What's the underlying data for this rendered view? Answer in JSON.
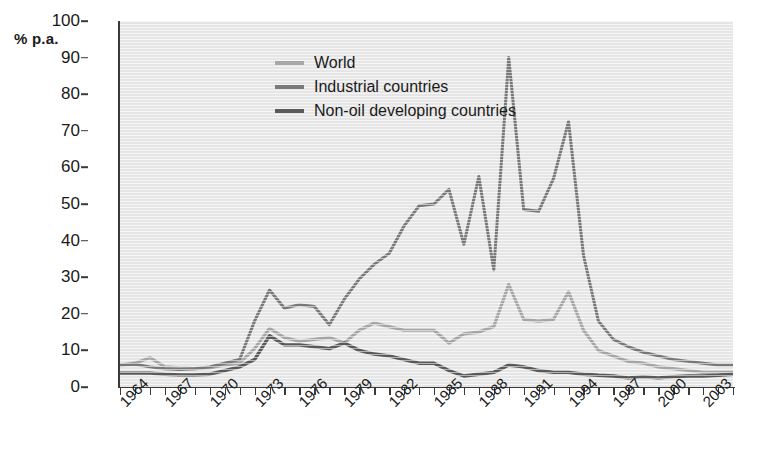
{
  "figure": {
    "y_unit_label": "% p.a.",
    "background_color": "#e9e9e9",
    "page_background": "#ffffff",
    "axis_color": "#3a3a3a",
    "text_color": "#1a1a1a"
  },
  "legend": {
    "position": "top-left-inside",
    "items": [
      {
        "label": "World",
        "color": "#a8a8a8",
        "swatch_name": "legend-swatch-world"
      },
      {
        "label": "Industrial countries",
        "color": "#7a7a7a",
        "swatch_name": "legend-swatch-industrial"
      },
      {
        "label": "Non-oil developing countries",
        "color": "#5a5a5a",
        "swatch_name": "legend-swatch-nonoil"
      }
    ]
  },
  "chart_data": {
    "type": "line",
    "title": "",
    "subtitle": "",
    "xlabel": "",
    "ylabel": "% p.a.",
    "ylim": [
      0,
      100
    ],
    "xlim": [
      1964,
      2005
    ],
    "grid": false,
    "legend_position": "top-left",
    "ytick_values": [
      0,
      10,
      20,
      30,
      40,
      50,
      60,
      70,
      80,
      90,
      100
    ],
    "xtick_labels": [
      "1964",
      "1967",
      "1970",
      "1973",
      "1976",
      "1979",
      "1982",
      "1985",
      "1988",
      "1991",
      "1994",
      "1997",
      "2000",
      "2003"
    ],
    "xtick_values": [
      1964,
      1967,
      1970,
      1973,
      1976,
      1979,
      1982,
      1985,
      1988,
      1991,
      1994,
      1997,
      2000,
      2003
    ],
    "x": [
      1964,
      1965,
      1966,
      1967,
      1968,
      1969,
      1970,
      1971,
      1972,
      1973,
      1974,
      1975,
      1976,
      1977,
      1978,
      1979,
      1980,
      1981,
      1982,
      1983,
      1984,
      1985,
      1986,
      1987,
      1988,
      1989,
      1990,
      1991,
      1992,
      1993,
      1994,
      1995,
      1996,
      1997,
      1998,
      1999,
      2000,
      2001,
      2002,
      2003,
      2004,
      2005
    ],
    "series": [
      {
        "name": "World",
        "color": "#a8a8a8",
        "values": [
          6.0,
          6.5,
          8.0,
          5.5,
          5.2,
          5.0,
          5.2,
          6.0,
          6.5,
          10.5,
          16.0,
          13.5,
          12.5,
          13.0,
          13.5,
          12.0,
          15.5,
          17.5,
          16.5,
          15.5,
          15.5,
          15.5,
          12.0,
          14.5,
          15.0,
          16.5,
          28.0,
          18.5,
          18.0,
          18.5,
          26.0,
          15.5,
          10.0,
          8.5,
          7.0,
          6.5,
          5.5,
          5.0,
          4.5,
          4.0,
          4.0,
          4.0
        ]
      },
      {
        "name": "Industrial countries",
        "color": "#7a7a7a",
        "values": [
          6.0,
          6.2,
          5.5,
          5.0,
          4.8,
          5.0,
          5.5,
          6.5,
          7.5,
          18.0,
          26.5,
          21.5,
          22.5,
          22.0,
          17.0,
          24.0,
          29.5,
          33.5,
          36.5,
          44.0,
          49.5,
          50.0,
          54.0,
          39.0,
          57.5,
          32.0,
          90.0,
          48.5,
          48.0,
          57.0,
          72.5,
          36.0,
          18.0,
          13.0,
          11.0,
          9.5,
          8.5,
          7.5,
          7.0,
          6.5,
          6.0,
          6.0
        ]
      },
      {
        "name": "Non-oil developing countries",
        "color": "#5a5a5a",
        "values": [
          3.8,
          3.8,
          3.8,
          3.5,
          3.3,
          3.3,
          3.5,
          4.5,
          5.5,
          7.5,
          14.0,
          11.5,
          11.5,
          11.0,
          10.5,
          12.0,
          10.0,
          9.0,
          8.5,
          7.5,
          6.5,
          6.5,
          4.5,
          3.0,
          3.5,
          4.0,
          6.0,
          5.5,
          4.5,
          4.0,
          4.0,
          3.5,
          3.2,
          3.0,
          2.5,
          2.8,
          2.5,
          2.8,
          3.0,
          3.0,
          3.2,
          3.5
        ]
      }
    ]
  }
}
